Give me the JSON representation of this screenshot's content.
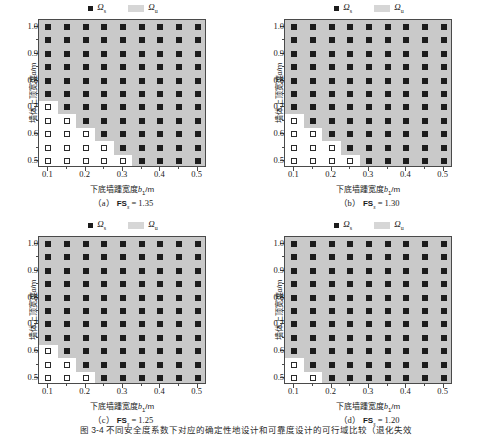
{
  "figure": {
    "caption": "图 3-4  不同安全度系数下对应的确定性地设计和可靠度设计的可行域比较（退化失效",
    "legend": {
      "safe_label": "Ω",
      "safe_sub": "s",
      "unsafe_label": "Ω",
      "unsafe_sub": "u",
      "safe_color": "#1c1c1c",
      "unsafe_color": "#d6d6d6"
    },
    "axes": {
      "xlabel_cn": "下底墙踵宽度",
      "xlabel_var": "b",
      "xlabel_sub": "1",
      "xlabel_unit": "/m",
      "ylabel_cn": "墙体上顶宽度",
      "ylabel_var": "a",
      "ylabel_unit": "/m",
      "xticks": [
        "0.1",
        "0.2",
        "0.3",
        "0.4",
        "0.5"
      ],
      "xtick_values": [
        0.1,
        0.2,
        0.3,
        0.4,
        0.5
      ],
      "yticks": [
        "0.5",
        "0.6",
        "0.7",
        "0.8",
        "0.9",
        "1.0"
      ],
      "ytick_values": [
        0.5,
        0.6,
        0.7,
        0.8,
        0.9,
        1.0
      ],
      "xlim": [
        0.075,
        0.525
      ],
      "ylim": [
        0.475,
        1.025
      ]
    }
  },
  "panels": [
    {
      "id": "a",
      "caption_index": "（a）",
      "caption_fs": "FS",
      "caption_sub": "s",
      "caption_value": "= 1.35"
    },
    {
      "id": "b",
      "caption_index": "（b）",
      "caption_fs": "FS",
      "caption_sub": "s",
      "caption_value": "= 1.30"
    },
    {
      "id": "c",
      "caption_index": "（c）",
      "caption_fs": "FS",
      "caption_sub": "s",
      "caption_value": "= 1.25"
    },
    {
      "id": "d",
      "caption_index": "（d）",
      "caption_fs": "FS",
      "caption_sub": "s",
      "caption_value": "= 1.20"
    }
  ],
  "chart_data": {
    "type": "scatter",
    "title": "不同安全度系数下对应的确定性地设计和可靠度设计的可行域比较",
    "xlabel": "下底墙踵宽度 b1/m",
    "ylabel": "墙体上顶宽度 a/m",
    "xlim": [
      0.075,
      0.525
    ],
    "ylim": [
      0.475,
      1.025
    ],
    "grid": false,
    "legend_position": "top-center",
    "x": [
      0.1,
      0.15,
      0.2,
      0.25,
      0.3,
      0.35,
      0.4,
      0.45,
      0.5
    ],
    "y": [
      0.5,
      0.55,
      0.6,
      0.65,
      0.7,
      0.75,
      0.8,
      0.85,
      0.9,
      0.95,
      1.0
    ],
    "series": [
      {
        "name": "(a) FSs = 1.35",
        "panel": "a",
        "legend": [
          "Ωs (safe, filled square on gray)",
          "Ωu (unsafe, open square on white)"
        ],
        "safe_min_x_by_y": {
          "1.00": 0.1,
          "0.95": 0.1,
          "0.90": 0.1,
          "0.85": 0.1,
          "0.80": 0.1,
          "0.75": 0.1,
          "0.70": 0.15,
          "0.65": 0.2,
          "0.60": 0.25,
          "0.55": 0.3,
          "0.50": 0.35
        }
      },
      {
        "name": "(b) FSs = 1.30",
        "panel": "b",
        "legend": [
          "Ωs (safe, filled square on gray)",
          "Ωu (unsafe, open square on white)"
        ],
        "safe_min_x_by_y": {
          "1.00": 0.1,
          "0.95": 0.1,
          "0.90": 0.1,
          "0.85": 0.1,
          "0.80": 0.1,
          "0.75": 0.1,
          "0.70": 0.1,
          "0.65": 0.15,
          "0.60": 0.2,
          "0.55": 0.25,
          "0.50": 0.3
        }
      },
      {
        "name": "(c) FSs = 1.25",
        "panel": "c",
        "legend": [
          "Ωs (safe, filled square on gray)",
          "Ωu (unsafe, open square on white)"
        ],
        "safe_min_x_by_y": {
          "1.00": 0.1,
          "0.95": 0.1,
          "0.90": 0.1,
          "0.85": 0.1,
          "0.80": 0.1,
          "0.75": 0.1,
          "0.70": 0.1,
          "0.65": 0.1,
          "0.60": 0.15,
          "0.55": 0.2,
          "0.50": 0.25
        }
      },
      {
        "id": "d",
        "name": "(d) FSs = 1.20",
        "panel": "d",
        "legend": [
          "Ωs (safe, filled square on gray)",
          "Ωu (unsafe, open square on white)"
        ],
        "safe_min_x_by_y": {
          "1.00": 0.1,
          "0.95": 0.1,
          "0.90": 0.1,
          "0.85": 0.1,
          "0.80": 0.1,
          "0.75": 0.1,
          "0.70": 0.1,
          "0.65": 0.1,
          "0.60": 0.1,
          "0.55": 0.15,
          "0.50": 0.2
        }
      }
    ]
  }
}
